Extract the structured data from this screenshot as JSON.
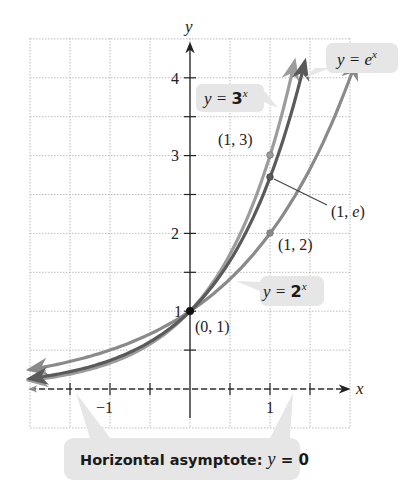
{
  "chart_data": {
    "type": "line",
    "title": "",
    "xlabel": "x",
    "ylabel": "y",
    "xlim": [
      -1.95,
      2.05
    ],
    "ylim": [
      -0.45,
      4.4
    ],
    "grid": true,
    "grid_step": 0.5,
    "x_tick_labels": [
      {
        "value": -1,
        "label": "−1"
      },
      {
        "value": 1,
        "label": "1"
      }
    ],
    "y_tick_labels": [
      {
        "value": 1,
        "label": "1"
      },
      {
        "value": 2,
        "label": "2"
      },
      {
        "value": 3,
        "label": "3"
      },
      {
        "value": 4,
        "label": "4"
      }
    ],
    "series": [
      {
        "name": "y = 2^x",
        "base": 2,
        "color": "#8a8a8a",
        "x": [
          -1.95,
          -1.5,
          -1,
          -0.5,
          0,
          0.5,
          1,
          1.5,
          2
        ],
        "values": [
          0.259,
          0.354,
          0.5,
          0.707,
          1,
          1.414,
          2,
          2.828,
          4
        ],
        "label": {
          "prefix": "y = ",
          "base": "2",
          "exp": "x"
        }
      },
      {
        "name": "y = e^x",
        "base": 2.718281828,
        "color": "#5a5a5a",
        "x": [
          -1.95,
          -1.5,
          -1,
          -0.5,
          0,
          0.5,
          1,
          1.386
        ],
        "values": [
          0.142,
          0.223,
          0.368,
          0.607,
          1,
          1.649,
          2.718,
          4
        ],
        "label": {
          "prefix": "y = ",
          "base": "e",
          "exp": "x"
        }
      },
      {
        "name": "y = 3^x",
        "base": 3,
        "color": "#9c9c9c",
        "x": [
          -1.95,
          -1.5,
          -1,
          -0.5,
          0,
          0.5,
          1,
          1.262
        ],
        "values": [
          0.117,
          0.192,
          0.333,
          0.577,
          1,
          1.732,
          3,
          4
        ],
        "label": {
          "prefix": "y = ",
          "base": "3",
          "exp": "x"
        }
      }
    ],
    "annotations": [
      {
        "text": "(0, 1)",
        "point": [
          0,
          1
        ]
      },
      {
        "text": "(1, 3)",
        "point": [
          1,
          3
        ]
      },
      {
        "text": "(1, e)",
        "point": [
          1,
          2.718
        ]
      },
      {
        "text": "(1, 2)",
        "point": [
          1,
          2
        ]
      },
      {
        "text": "Horizontal asymptote: y = 0"
      }
    ],
    "asymptote": {
      "y": 0,
      "style": "dashed"
    }
  },
  "labels": {
    "y_axis": "y",
    "x_axis": "x",
    "point_0_1": "(0, 1)",
    "point_1_3": "(1, 3)",
    "point_1_e_prefix": "(1, ",
    "point_1_e_var": "e",
    "point_1_e_suffix": ")",
    "point_1_2": "(1, 2)",
    "ex_prefix": "y = ",
    "ex_base": "e",
    "ex_exp": "x",
    "threex_prefix": "y = ",
    "threex_base": "3",
    "threex_exp": "x",
    "twox_prefix": "y = ",
    "twox_base": "2",
    "twox_exp": "x",
    "asymptote_text": "Horizontal asymptote: ",
    "asymptote_var": "y",
    "asymptote_eq": " = 0",
    "tick_1": "1",
    "tick_2": "2",
    "tick_3": "3",
    "tick_4": "4",
    "tick_neg1": "−1",
    "tick_x1": "1"
  },
  "colors": {
    "grid": "#b5b5b5",
    "axis": "#222222",
    "callout_bg": "#e6e6e6",
    "callout_text": "#1a1a1a",
    "point": "#111111"
  }
}
